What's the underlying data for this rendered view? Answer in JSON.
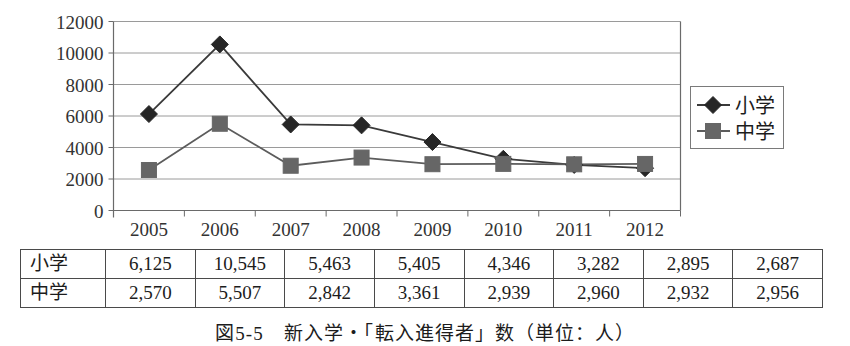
{
  "figure": {
    "caption": "図5-5　新入学・「転入進得者」数（単位：人）"
  },
  "chart_data": {
    "type": "line",
    "title": "",
    "xlabel": "",
    "ylabel": "",
    "categories": [
      "2005",
      "2006",
      "2007",
      "2008",
      "2009",
      "2010",
      "2011",
      "2012"
    ],
    "series": [
      {
        "name": "小学",
        "marker": "diamond",
        "color": "#262626",
        "values": [
          6125,
          10545,
          5463,
          5405,
          4346,
          3282,
          2895,
          2687
        ]
      },
      {
        "name": "中学",
        "marker": "square",
        "color": "#666666",
        "values": [
          2570,
          5507,
          2842,
          3361,
          2939,
          2960,
          2932,
          2956
        ]
      }
    ],
    "ylim": [
      0,
      12000
    ],
    "ytick_labels": [
      "0",
      "2000",
      "4000",
      "6000",
      "8000",
      "10000",
      "12000"
    ],
    "ytick_values": [
      0,
      2000,
      4000,
      6000,
      8000,
      10000,
      12000
    ],
    "grid": "horizontal",
    "legend_position": "right",
    "legend_entries": [
      "小学",
      "中学"
    ]
  },
  "table": {
    "rows": [
      {
        "label": "小学",
        "cells": [
          "6,125",
          "10,545",
          "5,463",
          "5,405",
          "4,346",
          "3,282",
          "2,895",
          "2,687"
        ]
      },
      {
        "label": "中学",
        "cells": [
          "2,570",
          "5,507",
          "2,842",
          "3,361",
          "2,939",
          "2,960",
          "2,932",
          "2,956"
        ]
      }
    ]
  }
}
